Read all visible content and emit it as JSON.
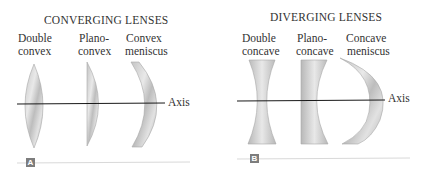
{
  "panels": [
    {
      "id": "A",
      "title": "CONVERGING LENSES",
      "badge": "A",
      "axis_label": "Axis",
      "lenses": [
        {
          "line1": "Double",
          "line2": "convex"
        },
        {
          "line1": "Plano-",
          "line2": "convex"
        },
        {
          "line1": "Convex",
          "line2": "meniscus"
        }
      ]
    },
    {
      "id": "B",
      "title": "DIVERGING LENSES",
      "badge": "B",
      "axis_label": "Axis",
      "lenses": [
        {
          "line1": "Double",
          "line2": "concave"
        },
        {
          "line1": "Plano-",
          "line2": "concave"
        },
        {
          "line1": "Concave",
          "line2": "meniscus"
        }
      ]
    }
  ],
  "colors": {
    "lens_light": "#ececec",
    "lens_dark": "#b4b4b4",
    "axis": "#1a1a1a",
    "badge": "#7d7d7d",
    "rule": "#d9d9d9"
  }
}
